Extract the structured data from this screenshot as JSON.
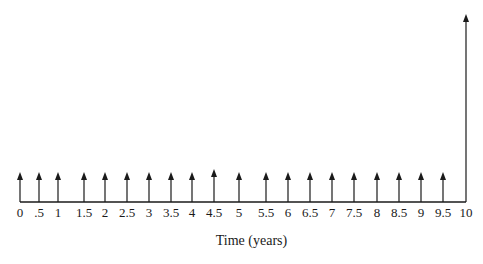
{
  "chart_data": {
    "type": "cash-flow-diagram",
    "title": "",
    "xlabel": "Time (years)",
    "ylabel": "",
    "x_range": [
      0,
      10
    ],
    "tick_labels": [
      "0",
      ".5",
      "1",
      "1.5",
      "2",
      "2.5",
      "3",
      "3.5",
      "4",
      "4.5",
      "5",
      "5.5",
      "6",
      "6.5",
      "7",
      "7.5",
      "8",
      "8.5",
      "9",
      "9.5",
      "10"
    ],
    "cash_flows": [
      {
        "t": 0,
        "direction": "up",
        "relative_size": 1
      },
      {
        "t": 0.5,
        "direction": "up",
        "relative_size": 1
      },
      {
        "t": 1,
        "direction": "up",
        "relative_size": 1
      },
      {
        "t": 1.5,
        "direction": "up",
        "relative_size": 1
      },
      {
        "t": 2,
        "direction": "up",
        "relative_size": 1
      },
      {
        "t": 2.5,
        "direction": "up",
        "relative_size": 1
      },
      {
        "t": 3,
        "direction": "up",
        "relative_size": 1
      },
      {
        "t": 3.5,
        "direction": "up",
        "relative_size": 1
      },
      {
        "t": 4,
        "direction": "up",
        "relative_size": 1
      },
      {
        "t": 4.5,
        "direction": "up",
        "relative_size": 1
      },
      {
        "t": 5,
        "direction": "up",
        "relative_size": 1
      },
      {
        "t": 5.5,
        "direction": "up",
        "relative_size": 1
      },
      {
        "t": 6,
        "direction": "up",
        "relative_size": 1
      },
      {
        "t": 6.5,
        "direction": "up",
        "relative_size": 1
      },
      {
        "t": 7,
        "direction": "up",
        "relative_size": 1
      },
      {
        "t": 7.5,
        "direction": "up",
        "relative_size": 1
      },
      {
        "t": 8,
        "direction": "up",
        "relative_size": 1
      },
      {
        "t": 8.5,
        "direction": "up",
        "relative_size": 1
      },
      {
        "t": 9,
        "direction": "up",
        "relative_size": 1
      },
      {
        "t": 9.5,
        "direction": "up",
        "relative_size": 1
      },
      {
        "t": 10,
        "direction": "up",
        "relative_size": 6.2
      }
    ]
  },
  "axis": {
    "title": "Time (years)",
    "labels": [
      "0",
      ".5",
      "1",
      "1.5",
      "2",
      "2.5",
      "3",
      "3.5",
      "4",
      "4.5",
      "5",
      "5.5",
      "6",
      "6.5",
      "7",
      "7.5",
      "8",
      "8.5",
      "9",
      "9.5",
      "10"
    ],
    "positions_px": [
      20,
      39,
      58,
      84,
      105,
      127,
      149,
      171,
      192,
      214,
      239,
      266,
      288,
      310,
      332,
      354,
      377,
      399,
      421,
      443,
      466
    ],
    "arrow_tops_px": [
      172,
      172,
      172,
      172,
      172,
      172,
      172,
      172,
      172,
      169,
      172,
      172,
      172,
      172,
      172,
      172,
      172,
      172,
      172,
      172,
      14
    ]
  },
  "colors": {
    "line": "#1a1a1a",
    "background": "#ffffff"
  }
}
